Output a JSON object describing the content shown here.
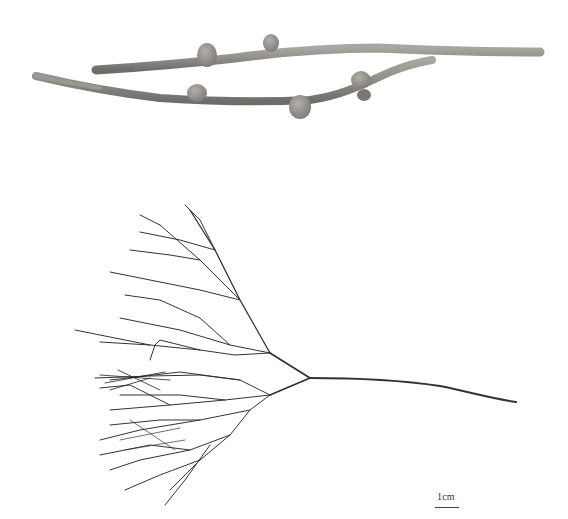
{
  "figure": {
    "panels": [
      {
        "id": "top",
        "description": "Close-up of two branch segments with rounded nodule-like swellings",
        "tone": "#8c8a86"
      },
      {
        "id": "bottom",
        "description": "Whole specimen: fan-shaped dichotomously branching thallus with long stipe",
        "tone": "#3a3a3a"
      }
    ],
    "scale_bar": {
      "label": "1cm"
    }
  }
}
